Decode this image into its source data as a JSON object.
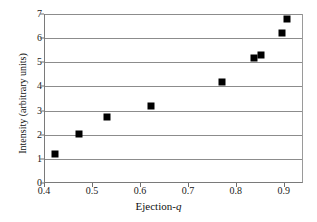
{
  "chart_data": {
    "type": "scatter",
    "title": "",
    "xlabel": "Ejection-q",
    "xlabel_prefix": "Ejection-",
    "xlabel_italic": "q",
    "ylabel": "Intensity (arbitrary units)",
    "xlim": [
      0.4,
      0.94
    ],
    "ylim": [
      0,
      7
    ],
    "xticks": [
      0.4,
      0.5,
      0.6,
      0.7,
      0.8,
      0.9
    ],
    "xtick_labels": [
      "0.4",
      "0.5",
      "0.6",
      "0.7",
      "0.8",
      "0.9"
    ],
    "yticks": [
      0,
      1,
      2,
      3,
      4,
      5,
      6,
      7
    ],
    "ytick_labels": [
      "0",
      "1",
      "2",
      "3",
      "4",
      "5",
      "6",
      "7"
    ],
    "grid": "horizontal",
    "legend": null,
    "marker": "filled-square",
    "marker_color": "#000000",
    "points": [
      {
        "x": 0.42,
        "y": 1.2
      },
      {
        "x": 0.47,
        "y": 2.05
      },
      {
        "x": 0.53,
        "y": 2.75
      },
      {
        "x": 0.62,
        "y": 3.2
      },
      {
        "x": 0.77,
        "y": 4.18
      },
      {
        "x": 0.835,
        "y": 5.18
      },
      {
        "x": 0.85,
        "y": 5.3
      },
      {
        "x": 0.895,
        "y": 6.2
      },
      {
        "x": 0.905,
        "y": 6.8
      }
    ],
    "x": [
      0.42,
      0.47,
      0.53,
      0.62,
      0.77,
      0.835,
      0.85,
      0.895,
      0.905
    ],
    "values": [
      1.2,
      2.05,
      2.75,
      3.2,
      4.18,
      5.18,
      5.3,
      6.2,
      6.8
    ]
  }
}
